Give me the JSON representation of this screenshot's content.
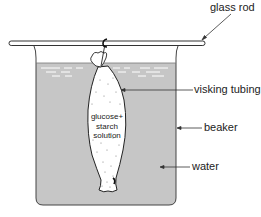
{
  "diagram": {
    "labels": {
      "glass_rod": "glass rod",
      "visking_tubing": "visking tubing",
      "beaker": "beaker",
      "water": "water"
    },
    "tubing_contents": {
      "line1": "glucose+",
      "line2": "starch",
      "line3": "solution"
    },
    "colors": {
      "water": "#c6c6c6",
      "outline": "#333333",
      "tubing_fill": "#ffffff",
      "beaker_air": "#ffffff"
    }
  }
}
